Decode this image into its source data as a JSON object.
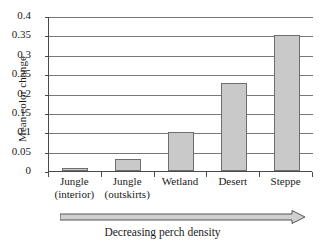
{
  "chart_data": {
    "type": "bar",
    "title": "",
    "xlabel": "Decreasing perch density",
    "ylabel": "Mean color change",
    "categories": [
      "Jungle\n(interior)",
      "Jungle\n(outskirts)",
      "Wetland",
      "Desert",
      "Steppe"
    ],
    "category_lines": [
      [
        "Jungle",
        "(interior)"
      ],
      [
        "Jungle",
        "(outskirts)"
      ],
      [
        "Wetland",
        ""
      ],
      [
        "Desert",
        ""
      ],
      [
        "Steppe",
        ""
      ]
    ],
    "values": [
      0.008,
      0.03,
      0.1,
      0.228,
      0.35
    ],
    "ylim": [
      0,
      0.4
    ],
    "ytick_labels": [
      "0",
      "0.05",
      "0.1",
      "0.15",
      "0.2",
      "0.25",
      "0.3",
      "0.35",
      "0.4"
    ],
    "ytick_values": [
      0,
      0.05,
      0.1,
      0.15,
      0.2,
      0.25,
      0.3,
      0.35,
      0.4
    ],
    "grid": true,
    "legend": null,
    "bar_color": "#c9c9c9",
    "bar_border_color": "#6e6e6e",
    "axis_color": "#4a4a4a",
    "grid_color": "#777777",
    "annotation": {
      "arrow_direction": "right",
      "arrow_label": "Decreasing perch density"
    }
  }
}
